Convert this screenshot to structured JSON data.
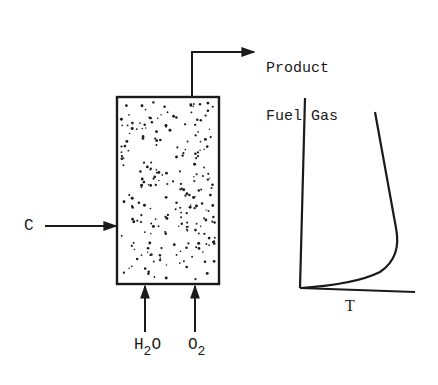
{
  "diagram": {
    "reactor": {
      "label": "fixed-bed gasifier",
      "fill": "particle bed (dotted)"
    },
    "outlet": {
      "line1": "Product",
      "line2": "Fuel Gas"
    },
    "inlets": {
      "side": {
        "label": "C"
      },
      "bottom_left": {
        "main": "H",
        "sub": "2",
        "tail": "O"
      },
      "bottom_right": {
        "main": "O",
        "sub": "2"
      }
    },
    "profile_plot": {
      "xlabel": "T",
      "ylabel": "",
      "description": "Temperature vs. bed height: rises sharply near the bottom, peaks, then decreases gradually toward the top"
    },
    "colors": {
      "ink": "#1a1a1a",
      "background": "#ffffff"
    }
  }
}
